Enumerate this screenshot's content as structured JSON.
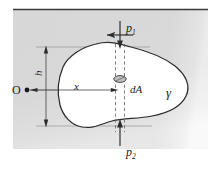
{
  "figure": {
    "background": {
      "fluid_fill": "#d9d9d9",
      "body_fill": "#ffffff",
      "line_color": "#2b2b2b",
      "thin_line_color": "#6e6e6e",
      "dash_color": "#5a5a5a",
      "page_color": "#ffffff"
    },
    "surface_line": {
      "label": "free-surface",
      "y": 10
    },
    "labels": {
      "p1": "p",
      "p1_sub": "1",
      "p2": "p",
      "p2_sub": "2",
      "origin": "O",
      "depth": "h",
      "x_coordinate": "x",
      "area_element": "dA",
      "gamma": "γ"
    },
    "arrows": {
      "p1_direction": "down",
      "p2_direction": "up",
      "h_dimension": "double-headed-vertical",
      "x_dimension": "horizontal-right"
    },
    "elements": [
      {
        "name": "fluid-region",
        "kind": "shaded-rectangle"
      },
      {
        "name": "submerged-body",
        "kind": "closed-blob-outline"
      },
      {
        "name": "area-element-ellipse",
        "kind": "small-ellipse"
      },
      {
        "name": "strip-dashed-lines",
        "kind": "vertical-dashed-pair"
      },
      {
        "name": "extension-lines",
        "kind": "thin-horizontal-pair"
      },
      {
        "name": "axis-line",
        "kind": "thin-horizontal"
      }
    ]
  }
}
